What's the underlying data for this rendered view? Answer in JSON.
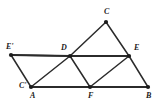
{
  "figure": {
    "type": "geometry-diagram",
    "width": 158,
    "height": 106,
    "background_color": "#ffffff",
    "stroke_color": "#2b2b2b",
    "vertex_dot_color": "#1b1b1b",
    "label_color": "#1b1b1b"
  },
  "points": [
    {
      "id": "Eprime",
      "label": "E'",
      "x": 11,
      "y": 55,
      "label_x": 6,
      "label_y": 43
    },
    {
      "id": "D",
      "label": "D",
      "x": 70,
      "y": 56,
      "label_x": 61,
      "label_y": 44
    },
    {
      "id": "E",
      "label": "E",
      "x": 129,
      "y": 56,
      "label_x": 134,
      "label_y": 44
    },
    {
      "id": "C",
      "label": "C",
      "x": 106,
      "y": 22,
      "label_x": 104,
      "label_y": 8
    },
    {
      "id": "Cprime",
      "label": "C'",
      "x": 31,
      "y": 87,
      "label_x": 19,
      "label_y": 82
    },
    {
      "id": "A",
      "label": "A",
      "x": 31,
      "y": 87,
      "label_x": 30,
      "label_y": 92
    },
    {
      "id": "F",
      "label": "F",
      "x": 90,
      "y": 87,
      "label_x": 88,
      "label_y": 92
    },
    {
      "id": "B",
      "label": "B",
      "x": 148,
      "y": 87,
      "label_x": 146,
      "label_y": 92
    }
  ],
  "segments": [
    {
      "id": "seg-Eprime-D",
      "from": "E'",
      "to": "D",
      "x1": 11,
      "y1": 55,
      "x2": 70,
      "y2": 56,
      "weight": "heavy"
    },
    {
      "id": "seg-D-E",
      "from": "D",
      "to": "E",
      "x1": 70,
      "y1": 56,
      "x2": 129,
      "y2": 56,
      "weight": "heavy"
    },
    {
      "id": "seg-A-F",
      "from": "A",
      "to": "F",
      "x1": 31,
      "y1": 87,
      "x2": 90,
      "y2": 87,
      "weight": "heavy"
    },
    {
      "id": "seg-F-B",
      "from": "F",
      "to": "B",
      "x1": 90,
      "y1": 87,
      "x2": 148,
      "y2": 87,
      "weight": "heavy"
    },
    {
      "id": "seg-Eprime-A",
      "from": "E'",
      "to": "A",
      "x1": 11,
      "y1": 55,
      "x2": 31,
      "y2": 87,
      "weight": "normal"
    },
    {
      "id": "seg-Eprime-D-diag",
      "from": "E'",
      "to": "D",
      "x1": 11,
      "y1": 55,
      "x2": 70,
      "y2": 56,
      "weight": "normal"
    },
    {
      "id": "seg-A-D",
      "from": "A",
      "to": "D",
      "x1": 31,
      "y1": 87,
      "x2": 70,
      "y2": 56,
      "weight": "normal"
    },
    {
      "id": "seg-D-F",
      "from": "D",
      "to": "F",
      "x1": 70,
      "y1": 56,
      "x2": 90,
      "y2": 87,
      "weight": "normal"
    },
    {
      "id": "seg-D-C",
      "from": "D",
      "to": "C",
      "x1": 70,
      "y1": 56,
      "x2": 106,
      "y2": 22,
      "weight": "normal"
    },
    {
      "id": "seg-C-E",
      "from": "C",
      "to": "E",
      "x1": 106,
      "y1": 22,
      "x2": 129,
      "y2": 56,
      "weight": "normal"
    },
    {
      "id": "seg-F-E",
      "from": "F",
      "to": "E",
      "x1": 90,
      "y1": 87,
      "x2": 129,
      "y2": 56,
      "weight": "normal"
    },
    {
      "id": "seg-E-B",
      "from": "E",
      "to": "B",
      "x1": 129,
      "y1": 56,
      "x2": 148,
      "y2": 87,
      "weight": "normal"
    }
  ]
}
